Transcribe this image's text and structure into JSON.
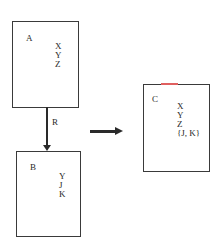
{
  "diagram": {
    "boxes": [
      {
        "id": "A",
        "label": "A",
        "attributes": [
          "X",
          "Y",
          "Z"
        ]
      },
      {
        "id": "B",
        "label": "B",
        "attributes": [
          "Y",
          "J",
          "K"
        ]
      },
      {
        "id": "C",
        "label": "C",
        "attributes": [
          "X",
          "Y",
          "Z",
          "{J, K}"
        ]
      }
    ],
    "relationship": {
      "from": "A",
      "to": "B",
      "label": "R"
    },
    "transform_arrow": {
      "from": "A-R-B",
      "to": "C"
    },
    "colors": {
      "line": "#2a2a2a",
      "accent_mark": "#e06060"
    }
  }
}
